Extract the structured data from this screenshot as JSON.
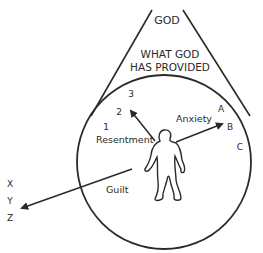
{
  "diagram": {
    "top_label": "GOD",
    "provision_label_line1": "WHAT GOD",
    "provision_label_line2": "HAS PROVIDED",
    "numbers": [
      "1",
      "2",
      "3"
    ],
    "letters_right": [
      "A",
      "B",
      "C"
    ],
    "letters_left": [
      "X",
      "Y",
      "Z"
    ],
    "arrows": {
      "resentment": "Resentment",
      "anxiety": "Anxiety",
      "guilt": "Guilt"
    },
    "colors": {
      "ink": "#2a2a2a",
      "background": "#ffffff"
    }
  }
}
